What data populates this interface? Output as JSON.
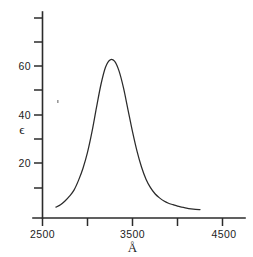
{
  "chart_data": {
    "type": "line",
    "title": "",
    "subtitle": "",
    "xlabel": "Å",
    "ylabel": "ϵ",
    "xlim": [
      2500,
      4500
    ],
    "ylim": [
      0,
      80
    ],
    "grid": false,
    "legend": null,
    "x_ticks": [
      2500,
      3000,
      3500,
      4000,
      4500
    ],
    "x_tick_labels": [
      "2500",
      "",
      "3500",
      "",
      "4500"
    ],
    "y_ticks": [
      0,
      10,
      20,
      30,
      40,
      50,
      60,
      70,
      80
    ],
    "y_tick_labels": [
      "",
      "",
      "20",
      "",
      "40",
      "",
      "60",
      "",
      ""
    ],
    "series": [
      {
        "name": "absorption",
        "x": [
          2650,
          2700,
          2750,
          2800,
          2850,
          2900,
          2950,
          3000,
          3050,
          3100,
          3150,
          3200,
          3250,
          3300,
          3350,
          3400,
          3450,
          3500,
          3550,
          3600,
          3650,
          3700,
          3750,
          3800,
          3850,
          3900,
          3950,
          4000,
          4050,
          4100,
          4150,
          4200,
          4250
        ],
        "y": [
          2,
          3,
          4.5,
          6.5,
          9,
          13,
          18,
          24.5,
          33,
          43,
          52.5,
          59.5,
          62.5,
          62,
          58,
          51,
          42,
          33,
          25,
          18.5,
          13.5,
          10,
          7.5,
          5.8,
          4.5,
          3.6,
          3,
          2.4,
          2,
          1.6,
          1.3,
          1.1,
          1
        ]
      }
    ],
    "peak": {
      "x": 3260,
      "y": 62.5
    },
    "axis_labels": {
      "x_min_label": "2500",
      "x_mid_label": "3500",
      "x_max_label": "4500",
      "y_low_label": "20",
      "y_mid_label": "40",
      "y_high_label": "60"
    },
    "colors": {
      "curve": "#2b2b2b",
      "axis": "#2b2b2b",
      "background": "#ffffff",
      "text": "#1d1d1d"
    }
  }
}
